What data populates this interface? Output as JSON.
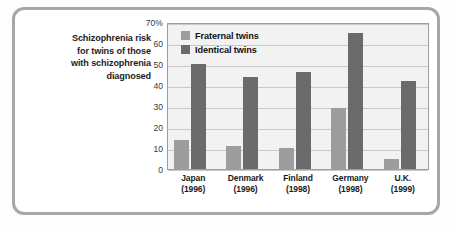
{
  "caption": {
    "lines": [
      "Schizophrenia risk",
      "for twins of those",
      "with schizophrenia",
      "diagnosed"
    ]
  },
  "chart_data": {
    "type": "bar",
    "title": "Schizophrenia risk for twins of those with schizophrenia diagnosed",
    "xlabel": "",
    "ylabel": "",
    "ylim": [
      0,
      70
    ],
    "yticks": [
      0,
      10,
      20,
      30,
      40,
      50,
      60,
      70
    ],
    "ytick_labels": [
      "0",
      "10",
      "20",
      "30",
      "40",
      "50",
      "60",
      "70%"
    ],
    "grid": true,
    "legend_position": "top-left inside plot",
    "categories": [
      "Japan",
      "Denmark",
      "Finland",
      "Germany",
      "U.K."
    ],
    "category_years": [
      "(1996)",
      "(1996)",
      "(1998)",
      "(1998)",
      "(1999)"
    ],
    "series": [
      {
        "name": "Fraternal twins",
        "color": "#9d9d9d",
        "values": [
          14,
          11,
          10,
          29,
          5
        ]
      },
      {
        "name": "Identical twins",
        "color": "#6b6b6b",
        "values": [
          50,
          44,
          46,
          65,
          42
        ]
      }
    ]
  },
  "colors": {
    "frame": "#a7a7a7",
    "plot_background": "#f2f2f2",
    "plot_border": "#9d9d9d",
    "gridline": "#c9c9c9",
    "fraternal": "#9d9d9d",
    "identical": "#6b6b6b"
  }
}
